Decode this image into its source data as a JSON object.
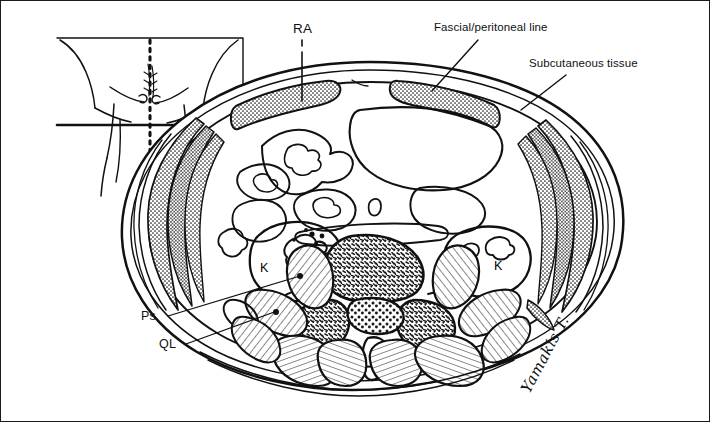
{
  "figure": {
    "type": "anatomical-line-drawing",
    "style": "black-and-white pen-and-ink illustration with stipple and hatch shading",
    "border_color": "#1a1a1a",
    "background_color": "#ffffff",
    "ink_color": "#111111"
  },
  "labels": {
    "ra": "RA",
    "fascial": "Fascial/peritoneal line",
    "subcutaneous": "Subcutaneous tissue",
    "ps": "Ps",
    "ql": "QL",
    "kidney_left": "K",
    "kidney_right": "K"
  },
  "label_meanings": {
    "ra": "rectus abdominis",
    "ps": "psoas muscle",
    "ql": "quadratus lumborum",
    "k": "kidney"
  },
  "signature": {
    "text": "Yamakis T.",
    "rotation_degrees": -62
  },
  "inset": {
    "name": "body-position-inset",
    "description": "frontal torso outline with dotted midline and horizontal slice-level line",
    "midline_style": "dotted",
    "level_line_style": "solid-thick"
  },
  "structures": [
    {
      "name": "skin-outline",
      "region": "perimeter"
    },
    {
      "name": "subcutaneous-fat-layer",
      "region": "perimeter"
    },
    {
      "name": "rectus-abdominis-left",
      "region": "anterior",
      "fill": "stipple"
    },
    {
      "name": "rectus-abdominis-right",
      "region": "anterior",
      "fill": "stipple"
    },
    {
      "name": "lateral-abdominal-wall-muscles-left",
      "region": "left-lateral",
      "fill": "stipple"
    },
    {
      "name": "lateral-abdominal-wall-muscles-right",
      "region": "right-lateral",
      "fill": "stipple"
    },
    {
      "name": "bowel-loops",
      "region": "central",
      "fill": "outline"
    },
    {
      "name": "kidney-left",
      "region": "left-posterior",
      "fill": "outline"
    },
    {
      "name": "kidney-right",
      "region": "right-posterior",
      "fill": "outline"
    },
    {
      "name": "vertebral-body",
      "region": "midline-posterior",
      "fill": "trabecular-stipple"
    },
    {
      "name": "spinal-canal-cauda-equina",
      "region": "midline-posterior",
      "fill": "coarse-stipple"
    },
    {
      "name": "psoas-muscle-left",
      "region": "paravertebral",
      "fill": "hatch"
    },
    {
      "name": "psoas-muscle-right",
      "region": "paravertebral",
      "fill": "hatch"
    },
    {
      "name": "quadratus-lumborum-left",
      "region": "posterolateral",
      "fill": "hatch"
    },
    {
      "name": "quadratus-lumborum-right",
      "region": "posterolateral",
      "fill": "hatch"
    },
    {
      "name": "erector-spinae-muscles",
      "region": "posterior",
      "fill": "hatch"
    }
  ]
}
